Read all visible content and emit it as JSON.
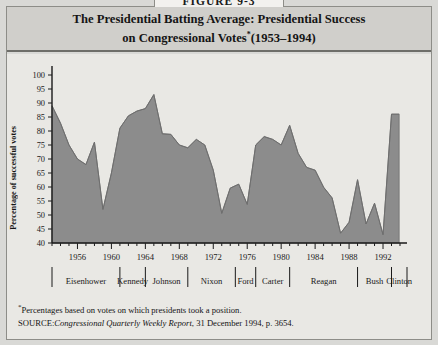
{
  "figure": {
    "number_label": "FIGURE 9-3",
    "title_line1": "The Presidential Batting Average: Presidential Success",
    "title_line2": "on Congressional Votes",
    "title_star": "*",
    "title_years": "(1953–1994)"
  },
  "footnotes": {
    "star_marker": "*",
    "star_text": "Percentages based on votes on which presidents took a position.",
    "source_label": "SOURCE:",
    "source_publication": "Congressional Quarterly Weekly Report",
    "source_rest": ", 31 December 1994, p. 3654."
  },
  "colors": {
    "area_fill": "#8c8c8c",
    "area_stroke": "#6e6e6e",
    "panel_background": "#e9e8e4",
    "header_background": "#d0cfcb",
    "card_background": "#d9d9d6",
    "axis": "#1a1a1a"
  },
  "chart_data": {
    "type": "area",
    "xlabel": "",
    "ylabel": "Percentage of successful votes",
    "ylim": [
      40,
      100
    ],
    "xlim": [
      1953,
      1994
    ],
    "ytick_step": 5,
    "yticks": [
      40,
      45,
      50,
      55,
      60,
      65,
      70,
      75,
      80,
      85,
      90,
      95,
      100
    ],
    "xticks_major": [
      1956,
      1960,
      1964,
      1968,
      1972,
      1976,
      1980,
      1984,
      1988,
      1992
    ],
    "xtick_minor_step": 1,
    "grid": false,
    "legend": "none",
    "x": [
      1953,
      1954,
      1955,
      1956,
      1957,
      1958,
      1959,
      1960,
      1961,
      1962,
      1963,
      1964,
      1965,
      1966,
      1967,
      1968,
      1969,
      1970,
      1971,
      1972,
      1973,
      1974,
      1975,
      1976,
      1977,
      1978,
      1979,
      1980,
      1981,
      1982,
      1983,
      1984,
      1985,
      1986,
      1987,
      1988,
      1989,
      1990,
      1991,
      1992,
      1993
    ],
    "values": [
      89.0,
      82.8,
      75.0,
      70.0,
      68.0,
      76.0,
      52.0,
      65.0,
      81.0,
      85.4,
      87.1,
      88.0,
      93.0,
      79.0,
      78.8,
      75.0,
      74.0,
      77.0,
      75.0,
      66.0,
      50.6,
      59.6,
      61.0,
      53.8,
      75.0,
      78.0,
      77.0,
      75.0,
      82.0,
      72.0,
      67.0,
      66.0,
      59.9,
      56.1,
      43.5,
      47.4,
      62.6,
      46.8,
      54.2,
      43.0,
      86.0
    ],
    "annotations": [
      {
        "text": "Lowest point, 1987 (Reagan)",
        "x": 1987,
        "y": 43.5
      },
      {
        "text": "Peak, 1965 (Johnson)",
        "x": 1965,
        "y": 93.0
      },
      {
        "text": "Clinton first year, 1993",
        "x": 1993,
        "y": 86.0
      }
    ]
  },
  "presidents": [
    {
      "name": "Eisenhower",
      "start": 1953,
      "end": 1961
    },
    {
      "name": "Kennedy",
      "start": 1961,
      "end": 1964
    },
    {
      "name": "Johnson",
      "start": 1964,
      "end": 1969
    },
    {
      "name": "Nixon",
      "start": 1969,
      "end": 1974.6
    },
    {
      "name": "Ford",
      "start": 1974.6,
      "end": 1977
    },
    {
      "name": "Carter",
      "start": 1977,
      "end": 1981
    },
    {
      "name": "Reagan",
      "start": 1981,
      "end": 1989
    },
    {
      "name": "Bush",
      "start": 1989,
      "end": 1993
    },
    {
      "name": "Clinton",
      "start": 1993,
      "end": 1995
    }
  ]
}
